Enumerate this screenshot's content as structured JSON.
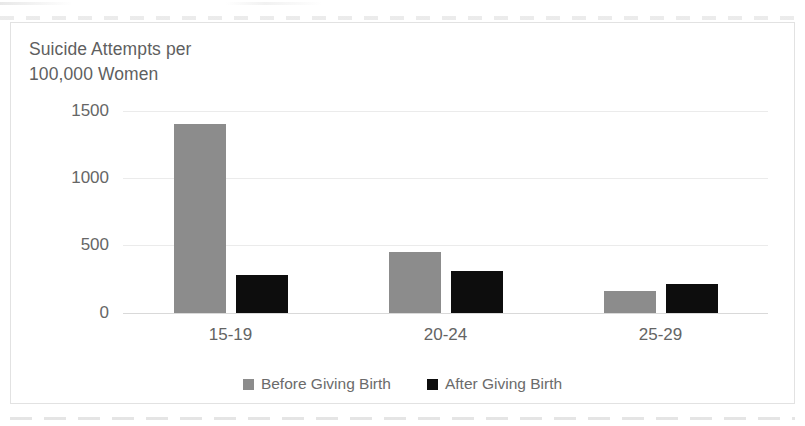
{
  "chart_data": {
    "type": "bar",
    "title": "Suicide  Attempts per\n100,000 Women",
    "xlabel": "",
    "ylabel": "",
    "categories": [
      "15-19",
      "20-24",
      "25-29"
    ],
    "series": [
      {
        "name": "Before Giving Birth",
        "color": "#8c8c8c",
        "values": [
          1400,
          450,
          160
        ]
      },
      {
        "name": "After Giving Birth",
        "color": "#0d0d0d",
        "values": [
          280,
          310,
          215
        ]
      }
    ],
    "ylim": [
      0,
      1500
    ],
    "yticks": [
      1500,
      1000,
      500,
      0
    ],
    "ytick_labels": [
      "1500",
      "1000",
      "500",
      "0"
    ],
    "grid": true,
    "legend_position": "bottom"
  },
  "colors": {
    "before": "#8c8c8c",
    "after": "#0d0d0d",
    "gridline": "#ebebeb",
    "text": "#646464",
    "frame": "#e2e2e2",
    "background": "#ffffff"
  }
}
